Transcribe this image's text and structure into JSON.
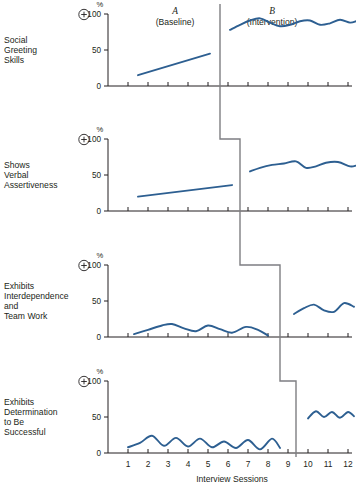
{
  "figure": {
    "x_axis_title": "Interview Sessions",
    "y_axis_unit": "%",
    "y_ticks": [
      "0",
      "50",
      "100"
    ],
    "x_ticks": [
      "1",
      "2",
      "3",
      "4",
      "5",
      "6",
      "7",
      "8",
      "9",
      "10",
      "11",
      "12"
    ],
    "direction_icon": "plus-in-circle-icon",
    "accent_color": "#2d5f91",
    "phase_line_color": "#7e7e82",
    "axis_color": "#231f20"
  },
  "phases": [
    {
      "letter": "A",
      "name": "(Baseline)"
    },
    {
      "letter": "B",
      "name": "(Intervention)"
    }
  ],
  "panels": [
    {
      "label": "Social\nGreeting\nSkills",
      "label_lines": [
        "Social",
        "Greeting",
        "Skills"
      ],
      "phase_change_session": 5.6
    },
    {
      "label": "Shows\nVerbal\nAssertiveness",
      "label_lines": [
        "Shows",
        "Verbal",
        "Assertiveness"
      ],
      "phase_change_session": 6.6
    },
    {
      "label": "Exhibits\nInterdependence\nand\nTeam Work",
      "label_lines": [
        "Exhibits",
        "Interdependence",
        "and",
        "Team Work"
      ],
      "phase_change_session": 8.6
    },
    {
      "label": "Exhibits\nDetermination\nto Be\nSuccessful",
      "label_lines": [
        "Exhibits",
        "Determination",
        "to Be",
        "Successful"
      ],
      "phase_change_session": 9.4
    }
  ],
  "chart_data": {
    "type": "line",
    "xlabel": "Interview Sessions",
    "ylabel": "%",
    "xlim": [
      0.3,
      12.5
    ],
    "ylim": [
      0,
      110
    ],
    "yticks": [
      0,
      50,
      100
    ],
    "xticks": [
      1,
      2,
      3,
      4,
      5,
      6,
      7,
      8,
      9,
      10,
      11,
      12
    ],
    "grid": false,
    "legend": null,
    "phase_labels": [
      "A (Baseline)",
      "B (Intervention)"
    ],
    "series": [
      {
        "name": "Social Greeting Skills",
        "panel": 1,
        "phase_change_session": 5.6,
        "baseline": {
          "phase": "A",
          "x": [
            1.5,
            2.2,
            3.0,
            3.8,
            4.6,
            5.1
          ],
          "y": [
            15,
            21,
            27,
            33,
            40,
            45
          ]
        },
        "intervention": {
          "phase": "B",
          "x": [
            6.1,
            6.6,
            7.1,
            7.6,
            8.1,
            8.6,
            9.1,
            9.6,
            10.1,
            10.6,
            11.1,
            11.6,
            12.1,
            12.4
          ],
          "y": [
            78,
            85,
            91,
            94,
            88,
            83,
            85,
            90,
            91,
            85,
            87,
            92,
            88,
            90
          ]
        }
      },
      {
        "name": "Shows Verbal Assertiveness",
        "panel": 2,
        "phase_change_session": 6.6,
        "baseline": {
          "phase": "A",
          "x": [
            1.5,
            2.5,
            3.5,
            4.5,
            5.5,
            6.2
          ],
          "y": [
            20,
            24,
            27,
            30,
            33,
            36
          ]
        },
        "intervention": {
          "phase": "B",
          "x": [
            7.1,
            7.6,
            8.2,
            8.8,
            9.4,
            9.9,
            10.4,
            10.9,
            11.5,
            12.1,
            12.4
          ],
          "y": [
            55,
            60,
            64,
            66,
            69,
            60,
            62,
            67,
            68,
            62,
            63
          ]
        }
      },
      {
        "name": "Exhibits Interdependence and Team Work",
        "panel": 3,
        "phase_change_session": 8.6,
        "baseline": {
          "phase": "A",
          "x": [
            1.3,
            2.0,
            2.7,
            3.2,
            3.8,
            4.4,
            5.0,
            5.6,
            6.2,
            6.9,
            7.5,
            8.0
          ],
          "y": [
            4,
            10,
            16,
            18,
            12,
            8,
            16,
            11,
            6,
            14,
            10,
            2
          ]
        },
        "intervention": {
          "phase": "B",
          "x": [
            9.3,
            9.8,
            10.3,
            10.8,
            11.3,
            11.8,
            12.3
          ],
          "y": [
            32,
            40,
            45,
            37,
            35,
            47,
            42
          ]
        }
      },
      {
        "name": "Exhibits Determination to Be Successful",
        "panel": 4,
        "phase_change_session": 9.4,
        "baseline": {
          "phase": "A",
          "x": [
            1.0,
            1.6,
            2.2,
            2.8,
            3.4,
            4.0,
            4.6,
            5.2,
            5.8,
            6.4,
            7.0,
            7.6,
            8.2,
            8.6
          ],
          "y": [
            8,
            14,
            24,
            10,
            21,
            9,
            20,
            8,
            16,
            7,
            18,
            5,
            20,
            7
          ]
        },
        "intervention": {
          "phase": "B",
          "x": [
            10.0,
            10.4,
            10.8,
            11.2,
            11.6,
            12.0,
            12.3
          ],
          "y": [
            48,
            58,
            50,
            57,
            49,
            57,
            51
          ]
        }
      }
    ]
  }
}
